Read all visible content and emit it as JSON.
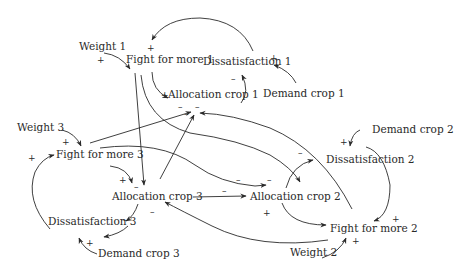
{
  "diagram": {
    "type": "causal-loop-diagram",
    "nodes": {
      "weight1": "Weight 1",
      "fight1": "Fight for more 1",
      "dissat1": "Dissatisfaction 1",
      "alloc1": "Allocation crop 1",
      "demand1": "Demand crop 1",
      "weight3": "Weight 3",
      "fight3": "Fight for more 3",
      "alloc3": "Allocation crop 3",
      "dissat3": "Dissatisfaction 3",
      "demand3": "Demand crop 3",
      "demand2": "Demand crop 2",
      "dissat2": "Dissatisfaction 2",
      "alloc2": "Allocation crop 2",
      "fight2": "Fight for more 2",
      "weight2": "Weight 2"
    },
    "signs": {
      "plus": "+",
      "minus": "–"
    },
    "edges": [
      {
        "from": "Weight 1",
        "to": "Fight for more 1",
        "polarity": "+"
      },
      {
        "from": "Dissatisfaction 1",
        "to": "Fight for more 1",
        "polarity": "+"
      },
      {
        "from": "Demand crop 1",
        "to": "Dissatisfaction 1",
        "polarity": "+"
      },
      {
        "from": "Allocation crop 1",
        "to": "Dissatisfaction 1",
        "polarity": "–"
      },
      {
        "from": "Fight for more 1",
        "to": "Allocation crop 1",
        "polarity": "+"
      },
      {
        "from": "Fight for more 1",
        "to": "Allocation crop 3",
        "polarity": "–"
      },
      {
        "from": "Fight for more 1",
        "to": "Allocation crop 2",
        "polarity": "–"
      },
      {
        "from": "Weight 3",
        "to": "Fight for more 3",
        "polarity": "+"
      },
      {
        "from": "Fight for more 3",
        "to": "Allocation crop 3",
        "polarity": "+"
      },
      {
        "from": "Fight for more 3",
        "to": "Allocation crop 1",
        "polarity": "–"
      },
      {
        "from": "Fight for more 3",
        "to": "Allocation crop 2",
        "polarity": "–"
      },
      {
        "from": "Allocation crop 3",
        "to": "Dissatisfaction 3",
        "polarity": "–"
      },
      {
        "from": "Allocation crop 3",
        "to": "Allocation crop 1",
        "polarity": "–"
      },
      {
        "from": "Allocation crop 3",
        "to": "Allocation crop 2",
        "polarity": "–"
      },
      {
        "from": "Demand crop 3",
        "to": "Dissatisfaction 3",
        "polarity": "+"
      },
      {
        "from": "Dissatisfaction 3",
        "to": "Fight for more 3",
        "polarity": "+"
      },
      {
        "from": "Demand crop 2",
        "to": "Dissatisfaction 2",
        "polarity": "+"
      },
      {
        "from": "Allocation crop 2",
        "to": "Dissatisfaction 2",
        "polarity": "–"
      },
      {
        "from": "Dissatisfaction 2",
        "to": "Fight for more 2",
        "polarity": "+"
      },
      {
        "from": "Allocation crop 2",
        "to": "Fight for more 2",
        "polarity": "+"
      },
      {
        "from": "Weight 2",
        "to": "Fight for more 2",
        "polarity": "+"
      },
      {
        "from": "Fight for more 2",
        "to": "Allocation crop 1",
        "polarity": "–"
      },
      {
        "from": "Fight for more 2",
        "to": "Allocation crop 3",
        "polarity": "–"
      },
      {
        "from": "Fight for more 2",
        "to": "Fight for more 1",
        "polarity": "+"
      }
    ]
  }
}
